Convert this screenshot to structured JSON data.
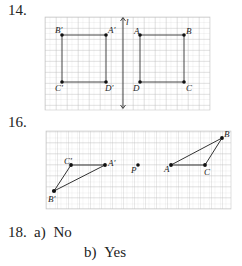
{
  "problems": [
    {
      "number": "14.",
      "figure": {
        "type": "reflection-across-line",
        "line_label": "l",
        "points": [
          {
            "label": "B′",
            "x": 62,
            "y": 35
          },
          {
            "label": "A′",
            "x": 106,
            "y": 35
          },
          {
            "label": "C′",
            "x": 62,
            "y": 82
          },
          {
            "label": "D′",
            "x": 106,
            "y": 82
          },
          {
            "label": "A",
            "x": 140,
            "y": 35
          },
          {
            "label": "B",
            "x": 184,
            "y": 35
          },
          {
            "label": "D",
            "x": 140,
            "y": 82
          },
          {
            "label": "C",
            "x": 184,
            "y": 82
          }
        ]
      }
    },
    {
      "number": "16.",
      "figure": {
        "type": "rotation-about-point",
        "center_label": "P",
        "points": [
          {
            "label": "C′",
            "x": 71,
            "y": 165
          },
          {
            "label": "A′",
            "x": 105,
            "y": 165
          },
          {
            "label": "B′",
            "x": 54,
            "y": 191
          },
          {
            "label": "P",
            "x": 138,
            "y": 165
          },
          {
            "label": "A",
            "x": 171,
            "y": 165
          },
          {
            "label": "C",
            "x": 205,
            "y": 165
          },
          {
            "label": "B",
            "x": 222,
            "y": 138
          }
        ]
      }
    },
    {
      "number": "18.",
      "answers": [
        {
          "part": "a)",
          "text": "No"
        },
        {
          "part": "b)",
          "text": "Yes"
        }
      ]
    }
  ]
}
